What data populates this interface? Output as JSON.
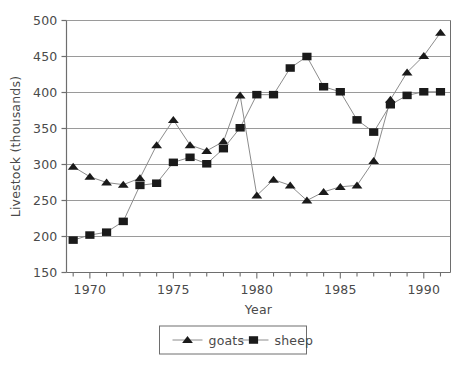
{
  "chart_data": {
    "type": "line",
    "title": "",
    "xlabel": "Year",
    "ylabel": "Livestock (thousands)",
    "xlim": [
      1968.6,
      1991.6
    ],
    "ylim": [
      150,
      500
    ],
    "ytick_step": 50,
    "yticks": [
      150,
      200,
      250,
      300,
      350,
      400,
      450,
      500
    ],
    "ytick_labels": [
      "150",
      "200",
      "250",
      "300",
      "350",
      "400",
      "450",
      "500"
    ],
    "xticks": [
      1969,
      1970,
      1971,
      1972,
      1973,
      1974,
      1975,
      1976,
      1977,
      1978,
      1979,
      1980,
      1981,
      1982,
      1983,
      1984,
      1985,
      1986,
      1987,
      1988,
      1989,
      1990,
      1991
    ],
    "xtick_labels": [
      "",
      "1970",
      "",
      "",
      "",
      "",
      "1975",
      "",
      "",
      "",
      "",
      "1980",
      "",
      "",
      "",
      "",
      "1985",
      "",
      "",
      "",
      "",
      "1990",
      ""
    ],
    "grid": "horizontal",
    "legend_position": "below",
    "x": [
      1969,
      1970,
      1971,
      1972,
      1973,
      1974,
      1975,
      1976,
      1977,
      1978,
      1979,
      1980,
      1981,
      1982,
      1983,
      1984,
      1985,
      1986,
      1987,
      1988,
      1989,
      1990,
      1991
    ],
    "series": [
      {
        "name": "goats",
        "marker": "triangle",
        "color": "#1a1a1a",
        "values": [
          297,
          283,
          275,
          272,
          281,
          327,
          362,
          327,
          319,
          332,
          396,
          257,
          279,
          271,
          250,
          262,
          269,
          271,
          305,
          390,
          428,
          451,
          483
        ]
      },
      {
        "name": "sheep",
        "marker": "square",
        "color": "#1a1a1a",
        "values": [
          195,
          202,
          206,
          221,
          271,
          274,
          303,
          310,
          301,
          322,
          351,
          397,
          397,
          434,
          450,
          408,
          401,
          362,
          345,
          383,
          396,
          401,
          401
        ]
      }
    ]
  },
  "legend": {
    "items": [
      {
        "label": "goats",
        "marker": "triangle"
      },
      {
        "label": "sheep",
        "marker": "square"
      }
    ]
  },
  "colors": {
    "series_marker": "#1a1a1a",
    "series_line": "#8c8c8c",
    "gridline": "#9a9a9a",
    "axis": "#6e6e6e",
    "text": "#4a4a4a",
    "background": "#ffffff"
  }
}
